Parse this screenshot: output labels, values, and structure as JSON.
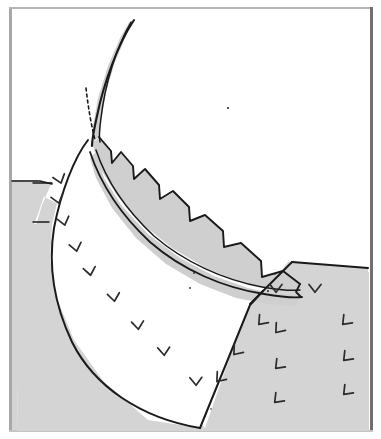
{
  "figure": {
    "width": 381,
    "height": 439,
    "background_color": "#ffffff"
  },
  "frame": {
    "name": "figure-border",
    "left_color": "#a8a8a8",
    "top_color": "#b4b4b4",
    "right_color": "#707070",
    "bottom_color": "#c4c4c4",
    "inset_left": 9,
    "inset_top": 7,
    "inset_right": 8,
    "inset_bottom": 7,
    "thickness": 3
  },
  "palette": {
    "terrain_gray": "#d4d4d4",
    "band_gray": "#cfcfcf",
    "white_fill": "#ffffff",
    "ink": "#1a1a1a",
    "ink_soft": "#2b2b2b"
  },
  "layers": [
    {
      "id": "background-terrain-left",
      "label": "Left hillside (shaded bedrock)",
      "fill": "#d4d4d4",
      "path": "M 12,180 L 36,180 L 44,183 L 50,183 L 44,196 L 38,214 L 34,224 L 50,224 L 38,240 L 30,268 L 24,300 L 20,340 L 18,380 L 17,430 L 12,430 Z"
    },
    {
      "id": "background-terrain-block",
      "label": "Lower shaded bedrock block beneath the wedge",
      "fill": "#d4d4d4",
      "path": "M 12,180 L 52,182 L 42,205 L 34,232 L 27,266 L 21,310 L 18,360 L 17,431 L 369,431 L 369,272 L 300,266 L 288,262 L 277,276 L 262,292 L 248,305 L 205,428 L 176,396 L 140,352 L 106,300 L 78,248 L 60,205 Z"
    },
    {
      "id": "right-terrain-block",
      "label": "Right hillside block with cleavage ticks",
      "fill": "#d4d4d4",
      "path": "M 292,262 L 368,268 L 368,431 L 207,431 L 250,305 Z"
    },
    {
      "id": "white-wedge",
      "label": "White core wedge (footwall limb of the fold)",
      "fill": "#ffffff",
      "path": "M 86,140 L 72,158 L 60,190 L 52,225 L 50,258 L 56,296 L 74,340 L 104,382 L 148,420 L 200,428 L 250,304 L 262,291 L 246,290 L 220,286 L 186,272 L 150,250 L 120,220 L 100,188 L 90,162 Z"
    },
    {
      "id": "fold-band-outer",
      "label": "Curved competent layer (upper gray band) with stepped erosional notches",
      "fill": "#cfcfcf",
      "path": "M 92,143 L 100,137 L 112,152 L 112,164 L 122,152 L 134,167 L 134,180 L 146,170 L 160,186 L 160,200 L 174,192 L 190,208 L 190,222 L 206,216 L 224,232 L 224,248 L 242,244 L 262,262 L 262,278 L 284,272 L 300,284 L 296,290 L 270,288 L 240,282 L 206,268 L 172,248 L 140,222 L 116,194 L 100,168 Z"
    },
    {
      "id": "fold-band-inner",
      "label": "Lower gray band layer below the internal bedding contact",
      "fill": "#cfcfcf",
      "path": "M 96,152 L 104,178 L 122,206 L 148,234 L 180,258 L 214,276 L 248,288 L 276,294 L 300,296 L 296,306 L 268,304 L 236,298 L 200,284 L 166,264 L 136,238 L 112,208 L 96,178 L 90,158 Z"
    },
    {
      "id": "fold-nose-sliver",
      "label": "Thin attenuated fold-nose sliver (hinge tip)",
      "fill": "#cfcfcf",
      "path": "M 130,21 L 120,38 L 108,66 L 98,98 L 93,126 L 92,143 L 100,136 L 101,120 L 106,92 L 115,62 L 126,36 Z"
    }
  ],
  "strokes": [
    {
      "id": "nose-outer-curve",
      "label": "Outer hinge trace of the fold nose",
      "width": 2.1,
      "path": "M 134,20 C 118,44 104,82 97,116 C 93,134 92,142 92,146"
    },
    {
      "id": "nose-inner-curve",
      "label": "Inner hinge trace of the fold nose",
      "width": 1.5,
      "path": "M 131,22 C 116,48 105,84 101,118 C 99,132 99,138 100,142"
    },
    {
      "id": "wedge-left-outline",
      "label": "Left (western) erosional slope of the white wedge",
      "width": 2.0,
      "path": "M 88,140 C 74,158 61,192 54,228 C 48,266 54,304 72,342 C 94,386 140,418 200,428"
    },
    {
      "id": "wedge-right-outline",
      "label": "Right-hand cut face of the white wedge",
      "width": 2.0,
      "path": "M 200,428 L 250,305 L 263,291"
    },
    {
      "id": "wedge-top-contact",
      "label": "Contact between white wedge and the lower gray band",
      "width": 1.8,
      "path": "M 90,152 C 100,182 120,214 150,242 C 182,270 224,288 264,294 C 282,297 294,298 302,297"
    },
    {
      "id": "band-internal-bedding",
      "label": "Internal bedding contact dividing the band into two layers",
      "width": 1.5,
      "path": "M 96,150 C 106,180 126,210 154,236 C 184,262 224,280 262,287 C 280,290 292,291 300,290"
    },
    {
      "id": "band-top-stepped",
      "label": "Stepped (notched) upper surface of the competent band",
      "width": 1.9,
      "path": "M 99,137 L 111,151 L 112,163 L 121,152 L 133,166 L 134,179 L 145,169 L 159,185 L 160,199 L 173,191 L 189,207 L 190,221 L 205,215 L 223,231 L 224,247 L 241,243 L 261,261 L 262,277 L 283,271 L 300,284"
    },
    {
      "id": "band-right-terminus",
      "label": "Right terminus of the band against the hillside",
      "width": 1.8,
      "path": "M 300,284 L 296,292 L 301,297"
    },
    {
      "id": "right-block-top",
      "label": "Top surface of the right hillside block",
      "width": 2.0,
      "path": "M 292,262 L 368,268"
    },
    {
      "id": "right-block-scarp",
      "label": "Left scarp of the right hillside block",
      "width": 2.0,
      "path": "M 292,262 L 264,290 L 250,304"
    },
    {
      "id": "terrain-left-skyline",
      "label": "Skyline of the left shaded hillside",
      "width": 1.4,
      "path": "M 12,181 L 40,181 L 52,184"
    },
    {
      "id": "terrain-left-tick-a",
      "label": "Upper horizontal marker line on left slope",
      "width": 1.4,
      "path": "M 33,183 L 52,183"
    },
    {
      "id": "terrain-left-tick-b",
      "label": "Lower horizontal marker line on left slope",
      "width": 1.4,
      "path": "M 33,222 L 49,222"
    }
  ],
  "dashed_line": {
    "id": "axial-trace-dashed",
    "label": "Dashed axial-surface trace through the fold hinge",
    "width": 1.6,
    "dash_pattern": "3 3",
    "path": "M 86,88 C 88,106 91,124 95,140"
  },
  "cleavage_ticks": {
    "label": "Cleavage / foliation chevron symbols",
    "stroke_width": 1.7,
    "marks": [
      {
        "x": 60,
        "y": 180,
        "rotation": -18,
        "glyph": "v",
        "size": 6
      },
      {
        "x": 58,
        "y": 200,
        "rotation": -16,
        "glyph": "v",
        "size": 6
      },
      {
        "x": 64,
        "y": 222,
        "rotation": -14,
        "glyph": "v",
        "size": 6
      },
      {
        "x": 76,
        "y": 248,
        "rotation": -12,
        "glyph": "v",
        "size": 6
      },
      {
        "x": 90,
        "y": 272,
        "rotation": -10,
        "glyph": "v",
        "size": 6
      },
      {
        "x": 114,
        "y": 298,
        "rotation": -8,
        "glyph": "v",
        "size": 6
      },
      {
        "x": 138,
        "y": 326,
        "rotation": -6,
        "glyph": "v",
        "size": 6
      },
      {
        "x": 164,
        "y": 352,
        "rotation": -4,
        "glyph": "v",
        "size": 6
      },
      {
        "x": 196,
        "y": 382,
        "rotation": -2,
        "glyph": "v",
        "size": 6
      },
      {
        "x": 219,
        "y": 379,
        "rotation": 40,
        "glyph": "v",
        "size": 6
      },
      {
        "x": 236,
        "y": 352,
        "rotation": 40,
        "glyph": "v",
        "size": 6
      },
      {
        "x": 261,
        "y": 322,
        "rotation": 42,
        "glyph": "v",
        "size": 6
      },
      {
        "x": 276,
        "y": 289,
        "rotation": 0,
        "glyph": "v",
        "size": 6
      },
      {
        "x": 315,
        "y": 289,
        "rotation": 0,
        "glyph": "v",
        "size": 6
      },
      {
        "x": 278,
        "y": 330,
        "rotation": 40,
        "glyph": "v",
        "size": 6
      },
      {
        "x": 278,
        "y": 366,
        "rotation": 44,
        "glyph": "v",
        "size": 6
      },
      {
        "x": 277,
        "y": 400,
        "rotation": 44,
        "glyph": "v",
        "size": 6
      },
      {
        "x": 345,
        "y": 322,
        "rotation": 44,
        "glyph": "v",
        "size": 6
      },
      {
        "x": 346,
        "y": 358,
        "rotation": 44,
        "glyph": "v",
        "size": 6
      },
      {
        "x": 346,
        "y": 392,
        "rotation": 44,
        "glyph": "v",
        "size": 6
      }
    ]
  },
  "speck_marks": {
    "label": "Small ink specks / stipple artifacts",
    "marks": [
      {
        "x": 228,
        "y": 108,
        "r": 1.1
      },
      {
        "x": 194,
        "y": 273,
        "r": 0.9
      },
      {
        "x": 190,
        "y": 288,
        "r": 0.9
      },
      {
        "x": 268,
        "y": 291,
        "r": 1.0
      },
      {
        "x": 275,
        "y": 274,
        "r": 0.8
      },
      {
        "x": 211,
        "y": 409,
        "r": 0.8
      }
    ]
  }
}
